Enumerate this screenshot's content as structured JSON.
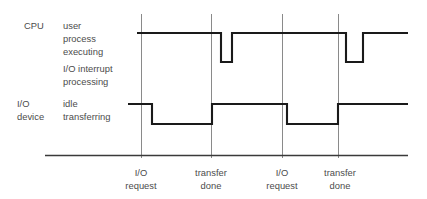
{
  "diagram": {
    "colors": {
      "waveform": "#1a1a1a",
      "gridline": "#8a8a8a",
      "text": "#4c4c4c",
      "baseline": "#3a3a3a",
      "background": "#ffffff"
    },
    "rows": [
      {
        "name": "cpu",
        "actor_label": "CPU",
        "state_labels": [
          "user",
          "process",
          "executing",
          "I/O interrupt",
          "processing"
        ],
        "high_state": "user process executing",
        "low_state": "I/O interrupt processing"
      },
      {
        "name": "io-device",
        "actor_label_line1": "I/O",
        "actor_label_line2": "device",
        "state_labels": [
          "idle",
          "transferring"
        ],
        "high_state": "idle",
        "low_state": "transferring"
      }
    ],
    "events": [
      {
        "index": 0,
        "line1": "I/O",
        "line2": "request",
        "x": 141
      },
      {
        "index": 1,
        "line1": "transfer",
        "line2": "done",
        "x": 211
      },
      {
        "index": 2,
        "line1": "I/O",
        "line2": "request",
        "x": 282
      },
      {
        "index": 3,
        "line1": "transfer",
        "line2": "done",
        "x": 338
      }
    ]
  },
  "chart_data": {
    "type": "line",
    "xlabel": "",
    "ylabel": "",
    "grid": true,
    "legend_position": "left",
    "x_event_ticks": [
      {
        "label": "I/O request",
        "x": 141
      },
      {
        "label": "transfer done",
        "x": 211
      },
      {
        "label": "I/O request",
        "x": 282
      },
      {
        "label": "transfer done",
        "x": 338
      }
    ],
    "series": [
      {
        "name": "CPU",
        "high_label": "user process executing",
        "low_label": "I/O interrupt processing",
        "y_high": 33,
        "y_low": 62,
        "points": [
          {
            "x": 137,
            "level": "high"
          },
          {
            "x": 221,
            "level": "high"
          },
          {
            "x": 221,
            "level": "low"
          },
          {
            "x": 232,
            "level": "low"
          },
          {
            "x": 232,
            "level": "high"
          },
          {
            "x": 346,
            "level": "high"
          },
          {
            "x": 346,
            "level": "low"
          },
          {
            "x": 363,
            "level": "low"
          },
          {
            "x": 363,
            "level": "high"
          },
          {
            "x": 408,
            "level": "high"
          }
        ]
      },
      {
        "name": "I/O device",
        "high_label": "idle",
        "low_label": "transferring",
        "y_high": 104,
        "y_low": 124,
        "points": [
          {
            "x": 128,
            "level": "high"
          },
          {
            "x": 152,
            "level": "high"
          },
          {
            "x": 152,
            "level": "low"
          },
          {
            "x": 212,
            "level": "low"
          },
          {
            "x": 212,
            "level": "high"
          },
          {
            "x": 287,
            "level": "high"
          },
          {
            "x": 287,
            "level": "low"
          },
          {
            "x": 338,
            "level": "low"
          },
          {
            "x": 338,
            "level": "high"
          },
          {
            "x": 408,
            "level": "high"
          }
        ]
      }
    ]
  }
}
